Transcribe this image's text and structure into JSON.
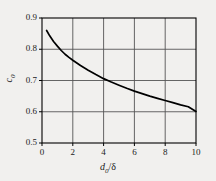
{
  "chart_data": {
    "type": "line",
    "title": "",
    "subtitle": "",
    "xlabel": "d0/δ",
    "ylabel": "c0",
    "xlabel_base": "d",
    "xlabel_sub": "0",
    "xlabel_tail": "/δ",
    "ylabel_base": "c",
    "ylabel_sub": "0",
    "xlim": [
      0,
      10
    ],
    "ylim": [
      0.5,
      0.9
    ],
    "xticks": [
      0,
      2,
      4,
      6,
      8,
      10
    ],
    "xtick_labels": [
      "0",
      "2",
      "4",
      "6",
      "8",
      "10"
    ],
    "yticks": [
      0.5,
      0.6,
      0.7,
      0.8,
      0.9
    ],
    "ytick_labels": [
      "0.5",
      "0.6",
      "0.7",
      "0.8",
      "0.9"
    ],
    "grid": true,
    "legend": null,
    "line_color": "#000000",
    "grid_color": "#555555",
    "axis_color": "#000000",
    "background_color": "#f1f0ee",
    "plot_background_color": "#f1f0ee",
    "series": [
      {
        "name": "c0 vs d0/delta",
        "x": [
          0.3,
          0.5,
          0.75,
          1.0,
          1.25,
          1.5,
          1.75,
          2.0,
          2.5,
          3.0,
          3.5,
          4.0,
          4.5,
          5.0,
          5.5,
          6.0,
          6.5,
          7.0,
          7.5,
          8.0,
          8.5,
          9.0,
          9.5,
          10.0
        ],
        "y": [
          0.86,
          0.843,
          0.825,
          0.81,
          0.796,
          0.784,
          0.774,
          0.765,
          0.748,
          0.733,
          0.719,
          0.706,
          0.695,
          0.685,
          0.675,
          0.666,
          0.658,
          0.65,
          0.643,
          0.636,
          0.629,
          0.622,
          0.616,
          0.601
        ]
      }
    ]
  },
  "figure": {
    "plot_left": 42,
    "plot_top": 18,
    "plot_right": 196,
    "plot_bottom": 143
  }
}
